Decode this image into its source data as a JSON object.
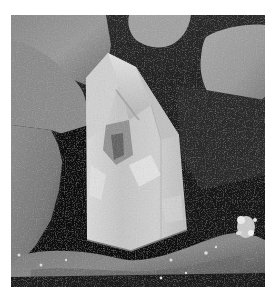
{
  "image": {
    "subject": "Clear quartz crystal point standing among rocks",
    "style": "grayscale photograph",
    "frame": {
      "background": "#ffffff",
      "x": 11,
      "y": 15,
      "width": 254,
      "height": 272
    },
    "colors": {
      "crystal_light": "#e6e6e6",
      "crystal_mid": "#bdbdbd",
      "crystal_shadow": "#6e6e6e",
      "rock_light": "#9a9a9a",
      "rock_mid": "#7c7c7c",
      "rock_dark": "#4a4a4a",
      "shadow": "#111111"
    },
    "elements": [
      {
        "name": "quartz-crystal",
        "description": "Tall hexagonal quartz point, center-left"
      },
      {
        "name": "rock-top-left",
        "description": "Large gray boulder upper left"
      },
      {
        "name": "rock-left",
        "description": "Gray rock on lower left edge"
      },
      {
        "name": "rock-top-center",
        "description": "Small pale rock at top center"
      },
      {
        "name": "rock-right",
        "description": "Large pale rock upper right"
      },
      {
        "name": "slab-bottom",
        "description": "Flat slab of rock under the crystal"
      },
      {
        "name": "sparkle-cluster",
        "description": "Bright mineral sparkle at lower right"
      }
    ]
  }
}
